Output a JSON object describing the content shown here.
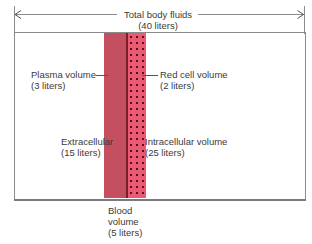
{
  "title": {
    "line1": "Total body fluids",
    "line2": "(40 liters)"
  },
  "compartments": {
    "plasma": {
      "label": "Plasma volume",
      "amount": "(3 liters)",
      "liters": 3,
      "color": "#c4505f"
    },
    "red_cell": {
      "label": "Red cell volume",
      "amount": "(2 liters)",
      "liters": 2,
      "color": "#ea5a72"
    },
    "extracellular": {
      "label": "Extracellular",
      "amount": "(15 liters)",
      "liters": 15
    },
    "intracellular": {
      "label": "Intracellular volume",
      "amount": "(25 liters)",
      "liters": 25
    },
    "blood": {
      "label_line1": "Blood",
      "label_line2": "volume",
      "amount": "(5 liters)",
      "liters": 5
    }
  },
  "total_liters": 40
}
